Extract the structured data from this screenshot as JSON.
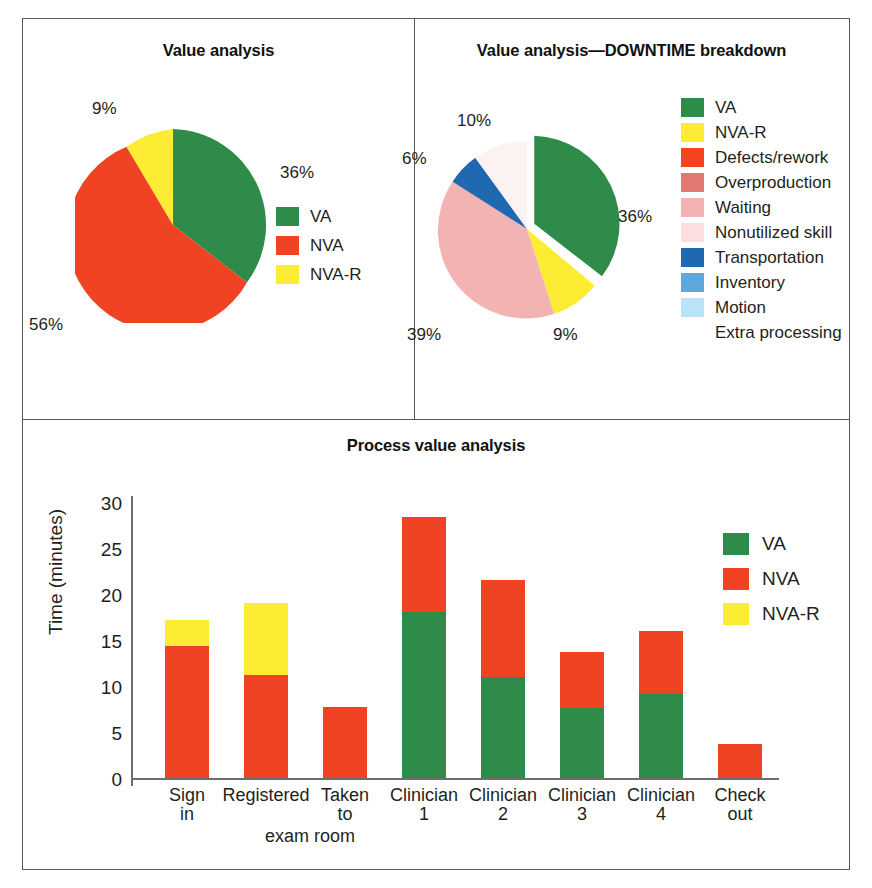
{
  "figure": {
    "panels": {
      "left_title": "Value analysis",
      "right_title": "Value analysis—DOWNTIME breakdown",
      "bottom_title": "Process value analysis"
    }
  },
  "pie_left": {
    "legend": [
      {
        "label": "VA",
        "color": "#2e8b4a"
      },
      {
        "label": "NVA",
        "color": "#ef4323"
      },
      {
        "label": "NVA-R",
        "color": "#fcec34"
      }
    ],
    "labels": {
      "va": "36%",
      "nva": "56%",
      "nvar": "9%"
    }
  },
  "pie_right": {
    "legend": [
      {
        "label": "VA",
        "color": "#2e8b4a"
      },
      {
        "label": "NVA-R",
        "color": "#fcec34"
      },
      {
        "label": "Defects/rework",
        "color": "#f4441f"
      },
      {
        "label": "Overproduction",
        "color": "#e2786f"
      },
      {
        "label": "Waiting",
        "color": "#f3b3b3"
      },
      {
        "label": "Nonutilized skill",
        "color": "#fbdede"
      },
      {
        "label": "Transportation",
        "color": "#2068b0"
      },
      {
        "label": "Inventory",
        "color": "#5fa8de"
      },
      {
        "label": "Motion",
        "color": "#b9e3f7"
      },
      {
        "label": "Extra processing",
        "color": "#ffffff"
      }
    ],
    "labels": {
      "va": "36%",
      "nvar": "9%",
      "waiting": "39%",
      "nonutilized": "10%",
      "transportation": "6%"
    }
  },
  "bar": {
    "legend": [
      {
        "label": "VA",
        "color": "#2e8b4a"
      },
      {
        "label": "NVA",
        "color": "#ef4323"
      },
      {
        "label": "NVA-R",
        "color": "#fcec34"
      }
    ],
    "ylabel": "Time (minutes)",
    "yticks": [
      "30",
      "25",
      "20",
      "15",
      "10",
      "5",
      "0"
    ],
    "xlabels": [
      "Sign\nin",
      "Registered",
      "Taken\nto",
      "Clinician\n1",
      "Clinician\n2",
      "Clinician\n3",
      "Clinician\n4",
      "Check\nout"
    ],
    "exam_room_note": "exam room"
  },
  "chart_data": [
    {
      "type": "pie",
      "title": "Value analysis",
      "categories": [
        "VA",
        "NVA",
        "NVA-R"
      ],
      "values": [
        36,
        56,
        9
      ],
      "data_labels": [
        "36%",
        "56%",
        "9%"
      ],
      "colors": [
        "#2e8b4a",
        "#ef4323",
        "#fcec34"
      ],
      "legend_position": "right",
      "start_angle_deg": 0,
      "direction": "clockwise"
    },
    {
      "type": "pie",
      "title": "Value analysis—DOWNTIME breakdown",
      "categories": [
        "VA",
        "NVA-R",
        "Waiting",
        "Nonutilized skill",
        "Transportation"
      ],
      "values": [
        36,
        9,
        39,
        10,
        6
      ],
      "data_labels": [
        "36%",
        "9%",
        "39%",
        "10%",
        "6%"
      ],
      "colors": [
        "#2e8b4a",
        "#fcec34",
        "#f3b3b3",
        "#fbdede",
        "#2068b0"
      ],
      "exploded_slice": "VA",
      "legend_entries": [
        "VA",
        "NVA-R",
        "Defects/rework",
        "Overproduction",
        "Waiting",
        "Nonutilized skill",
        "Transportation",
        "Inventory",
        "Motion",
        "Extra processing"
      ],
      "legend_position": "right",
      "start_angle_deg": 0,
      "direction": "clockwise"
    },
    {
      "type": "bar",
      "subtype": "stacked",
      "title": "Process value analysis",
      "xlabel": "",
      "ylabel": "Time (minutes)",
      "ylim": [
        0,
        30
      ],
      "yticks": [
        0,
        5,
        10,
        15,
        20,
        25,
        30
      ],
      "grid": false,
      "legend_position": "right",
      "categories": [
        "Sign in",
        "Registered",
        "Taken to exam room",
        "Clinician 1",
        "Clinician 2",
        "Clinician 3",
        "Clinician 4",
        "Check out"
      ],
      "series": [
        {
          "name": "VA",
          "color": "#2e8b4a",
          "values": [
            0,
            0,
            0,
            18.0,
            11.0,
            7.6,
            9.1,
            0
          ]
        },
        {
          "name": "NVA",
          "color": "#ef4323",
          "values": [
            14.3,
            11.2,
            7.7,
            10.4,
            10.5,
            6.1,
            6.9,
            3.7
          ]
        },
        {
          "name": "NVA-R",
          "color": "#fcec34",
          "values": [
            2.9,
            7.8,
            0,
            0,
            0,
            0,
            0,
            0
          ]
        }
      ],
      "totals": [
        17.2,
        19.0,
        7.7,
        28.4,
        21.5,
        13.7,
        16.0,
        3.7
      ]
    }
  ]
}
